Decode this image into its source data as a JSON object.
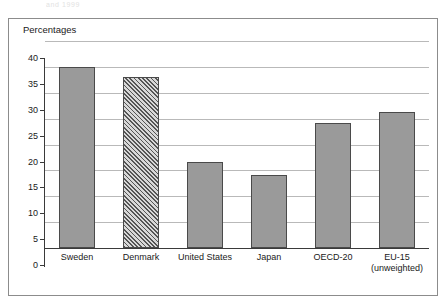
{
  "top_caption": "and 1999",
  "chart_data": {
    "type": "bar",
    "title": "",
    "subtitle": "",
    "xlabel": "",
    "ylabel": "Percentages",
    "axis_title": "Percentages",
    "categories": [
      "Sweden",
      "Denmark",
      "United States",
      "Japan",
      "OECD-20",
      "EU-15"
    ],
    "category_sublabels": [
      "",
      "",
      "",
      "",
      "",
      "(unweighted)"
    ],
    "values": [
      34.9,
      33.0,
      16.7,
      14.2,
      24.1,
      26.2
    ],
    "bar_styles": [
      "solid",
      "hatched",
      "solid",
      "solid",
      "solid",
      "solid"
    ],
    "ylim": [
      0,
      40
    ],
    "ytick_step": 5,
    "yticks": [
      0,
      5,
      10,
      15,
      20,
      25,
      30,
      35,
      40
    ],
    "ytick_labels": [
      "0",
      "5",
      "10",
      "15",
      "20",
      "25",
      "30",
      "35",
      "40"
    ],
    "grid": "horizontal",
    "legend": "none",
    "colors": {
      "bar_fill": "#9a9a9a",
      "bar_border": "#4a4a4a",
      "hatch_line": "#555555",
      "hatch_background": "#d8d8d8",
      "gridline": "#b9b9b9",
      "axis": "#3a3a3a",
      "frame": "#8c8c8c",
      "text": "#1a1a1a",
      "background": "#ffffff"
    }
  }
}
